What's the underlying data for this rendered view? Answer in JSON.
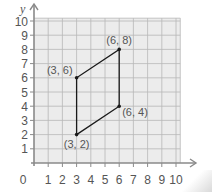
{
  "chart_data": {
    "type": "scatter",
    "title": "",
    "xlabel": "x",
    "ylabel": "y",
    "xlim": [
      0,
      10
    ],
    "ylim": [
      0,
      10
    ],
    "grid": true,
    "x_ticks": [
      "1",
      "2",
      "3",
      "4",
      "5",
      "6",
      "7",
      "8",
      "9",
      "10"
    ],
    "y_ticks": [
      "1",
      "2",
      "3",
      "4",
      "5",
      "6",
      "7",
      "8",
      "9",
      "10"
    ],
    "origin_label": "0",
    "shape": "parallelogram",
    "points": [
      {
        "x": 3,
        "y": 2,
        "label": "(3, 2)"
      },
      {
        "x": 6,
        "y": 4,
        "label": "(6, 4)"
      },
      {
        "x": 6,
        "y": 8,
        "label": "(6, 8)"
      },
      {
        "x": 3,
        "y": 6,
        "label": "(3, 6)"
      }
    ]
  },
  "colors": {
    "grid_bg": "#ececec",
    "grid_line": "#b8b8b8",
    "axis": "#8a8a8a",
    "shape": "#1a1a1a",
    "text": "#555555"
  }
}
